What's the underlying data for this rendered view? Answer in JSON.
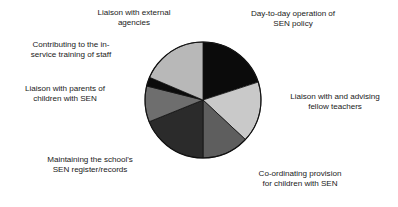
{
  "chart_data": {
    "type": "pie",
    "title": "",
    "subtitle": "",
    "xlabel": "",
    "ylabel": "",
    "legend_position": "none",
    "grid": false,
    "labels_placement": "outside-callout",
    "center": {
      "x": 203,
      "y": 100
    },
    "radius": 58,
    "start_angle_deg": 0,
    "direction": "clockwise",
    "categories": [
      "Day-to-day operation of SEN policy",
      "Liaison with and advising fellow teachers",
      "Co-ordinating provision for children with SEN",
      "Maintaining the school's SEN register/records",
      "Liaison with parents of children with SEN",
      "Contributing to the in-service training of staff",
      "Liaison with external agencies"
    ],
    "values": [
      20,
      17,
      13,
      19,
      10,
      2.5,
      18.5
    ],
    "units": "percent",
    "slices": [
      {
        "label": "Day-to-day operation of SEN policy",
        "label_line_1": "Day-to-day operation of",
        "label_line_2": "SEN policy",
        "value": 20,
        "start_deg": 0,
        "end_deg": 72,
        "color": "#0b0b0b"
      },
      {
        "label": "Liaison with and advising fellow teachers",
        "label_line_1": "Liaison with and advising",
        "label_line_2": "fellow teachers",
        "value": 17,
        "start_deg": 72,
        "end_deg": 133,
        "color": "#c9c9c9"
      },
      {
        "label": "Co-ordinating provision for children with SEN",
        "label_line_1": "Co-ordinating provision",
        "label_line_2": "for children with SEN",
        "value": 13,
        "start_deg": 133,
        "end_deg": 180,
        "color": "#5e5e5e"
      },
      {
        "label": "Maintaining the school's SEN register/records",
        "label_line_1": "Maintaining the school's",
        "label_line_2": "SEN register/records",
        "value": 19,
        "start_deg": 180,
        "end_deg": 248,
        "color": "#2b2b2b"
      },
      {
        "label": "Liaison with parents of children with SEN",
        "label_line_1": "Liaison with parents of",
        "label_line_2": "children with SEN",
        "value": 10,
        "start_deg": 248,
        "end_deg": 284,
        "color": "#6e6e6e"
      },
      {
        "label": "Contributing to the in-service training of staff",
        "label_line_1": "Contributing to the in-",
        "label_line_2": "service training of staff",
        "value": 2.5,
        "start_deg": 284,
        "end_deg": 293,
        "color": "#0b0b0b"
      },
      {
        "label": "Liaison with external agencies",
        "label_line_1": "Liaison with external",
        "label_line_2": "agencies",
        "value": 18.5,
        "start_deg": 293,
        "end_deg": 360,
        "color": "#b8b8b8"
      }
    ]
  },
  "figure": {
    "background_color": "#ffffff",
    "text_color": "#1a1a1a",
    "outline_color": "#111111"
  },
  "labels": {
    "daytoday": "Day-to-day operation of\nSEN policy",
    "fellow": "Liaison with and advising\nfellow teachers",
    "coord": "Co-ordinating provision\nfor children with SEN",
    "register": "Maintaining the school's\nSEN register/records",
    "parents": "Liaison with parents of\nchildren with SEN",
    "inservice": "Contributing to the in-\nservice training of staff",
    "external": "Liaison with external\nagencies"
  }
}
